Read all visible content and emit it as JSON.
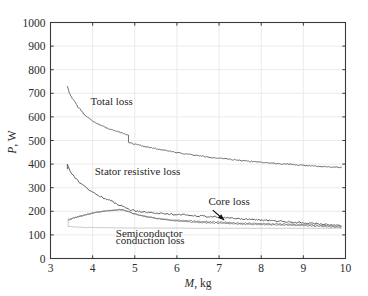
{
  "chart_data": {
    "type": "line",
    "title": "",
    "xlabel": "M, kg",
    "ylabel": "P, W",
    "xlim": [
      3,
      10
    ],
    "ylim": [
      0,
      1000
    ],
    "xticks": [
      "3",
      "4",
      "5",
      "6",
      "7",
      "8",
      "9",
      "10"
    ],
    "yticks": [
      "0",
      "100",
      "200",
      "300",
      "400",
      "500",
      "600",
      "700",
      "800",
      "900",
      "1000"
    ],
    "grid": true,
    "legend_position": "inline-annotations",
    "series": [
      {
        "name": "Total loss",
        "label": "Total loss",
        "color": "#6e6e6e",
        "x": [
          3.4,
          3.45,
          3.5,
          3.55,
          3.6,
          3.65,
          3.7,
          3.8,
          3.9,
          4.0,
          4.1,
          4.2,
          4.3,
          4.4,
          4.5,
          4.6,
          4.7,
          4.8,
          4.84,
          4.86,
          4.95,
          5.1,
          5.3,
          5.5,
          5.75,
          6.0,
          6.25,
          6.5,
          6.75,
          7.0,
          7.25,
          7.5,
          7.75,
          8.0,
          8.25,
          8.5,
          8.75,
          9.0,
          9.25,
          9.5,
          9.75,
          9.9
        ],
        "y": [
          730,
          700,
          683,
          672,
          660,
          640,
          635,
          610,
          596,
          583,
          573,
          564,
          556,
          549,
          543,
          537,
          531,
          526,
          524,
          492,
          487,
          480,
          472,
          465,
          457,
          449,
          442,
          436,
          430,
          425,
          420,
          416,
          412,
          408,
          404,
          401,
          398,
          395,
          392,
          390,
          387,
          386
        ]
      },
      {
        "name": "Stator resistive loss",
        "label": "Stator resistive loss",
        "color": "#5f5f5f",
        "x": [
          3.4,
          3.45,
          3.5,
          3.55,
          3.6,
          3.65,
          3.7,
          3.75,
          3.8,
          3.9,
          4.0,
          4.1,
          4.2,
          4.3,
          4.4,
          4.5,
          4.6,
          4.7,
          4.8,
          4.9,
          5.0,
          5.2,
          5.4,
          5.6,
          5.8,
          6.0,
          6.25,
          6.5,
          6.75,
          7.0,
          7.25,
          7.5,
          7.75,
          8.0,
          8.25,
          8.5,
          8.75,
          9.0,
          9.25,
          9.5,
          9.75,
          9.9
        ],
        "y": [
          400,
          378,
          362,
          350,
          340,
          330,
          322,
          314,
          306,
          292,
          281,
          270,
          262,
          254,
          246,
          238,
          230,
          222,
          214,
          207,
          203,
          198,
          194,
          191,
          189,
          187,
          184,
          181,
          178,
          175,
          172,
          169,
          166,
          163,
          160,
          157,
          154,
          151,
          148,
          145,
          142,
          140
        ]
      },
      {
        "name": "Core loss",
        "label": "Core loss",
        "color": "#7a7a7a",
        "x": [
          3.42,
          3.48,
          3.55,
          3.65,
          3.75,
          3.85,
          3.95,
          4.05,
          4.15,
          4.25,
          4.35,
          4.45,
          4.55,
          4.65,
          4.75,
          4.85,
          4.95,
          5.1,
          5.25,
          5.45,
          5.65,
          5.85,
          6.05,
          6.25,
          6.5,
          6.75,
          7.0,
          7.25,
          7.5,
          7.75,
          8.0,
          8.25,
          8.5,
          8.75,
          9.0,
          9.25,
          9.5,
          9.75,
          9.9
        ],
        "y": [
          163,
          168,
          172,
          177,
          181,
          186,
          190,
          194,
          197,
          200,
          202,
          204,
          206,
          207,
          205,
          199,
          191,
          184,
          178,
          172,
          167,
          163,
          160,
          158,
          155,
          153,
          152,
          150,
          148,
          147,
          146,
          145,
          144,
          143,
          142,
          140,
          138,
          135,
          133
        ]
      },
      {
        "name": "Semiconductor conduction loss",
        "label": "Semiconductor conduction loss",
        "color": "#c4c4c4",
        "x": [
          3.42,
          3.6,
          4.0,
          4.5,
          5.0,
          5.5,
          6.0,
          6.5,
          7.0,
          7.5,
          8.0,
          8.5,
          9.0,
          9.5,
          9.9
        ],
        "y": [
          136,
          133,
          131,
          130,
          129,
          129,
          129,
          128,
          128,
          128,
          128,
          128,
          128,
          128,
          128
        ]
      }
    ],
    "annotations": [
      {
        "text": "Total loss",
        "x": 3.95,
        "y": 650,
        "name": "total-loss-label"
      },
      {
        "text": "Stator resistive loss",
        "x": 4.05,
        "y": 355,
        "name": "stator-resistive-loss-label"
      },
      {
        "text": "Core loss",
        "x": 6.75,
        "y": 225,
        "name": "core-loss-label"
      },
      {
        "text": "Semiconductor",
        "x": 4.55,
        "y": 92,
        "name": "semiconductor-label-line1"
      },
      {
        "text": "conduction loss",
        "x": 4.55,
        "y": 62,
        "name": "semiconductor-label-line2"
      }
    ],
    "arrow": {
      "from_x": 6.85,
      "from_y": 205,
      "to_x": 7.12,
      "to_y": 163,
      "name": "core-loss-arrow"
    }
  },
  "axes": {
    "x_title_italic": "M",
    "x_title_rest": ", kg",
    "y_title_italic": "P",
    "y_title_rest": ", W"
  },
  "colors": {
    "axis": "#3a3a3a",
    "grid": "#eceaea",
    "total_loss": "#6e6e6e",
    "stator_resistive_loss": "#5f5f5f",
    "core_loss": "#7a7a7a",
    "semiconductor_loss": "#c4c4c4",
    "text": "#1f1f1f"
  }
}
